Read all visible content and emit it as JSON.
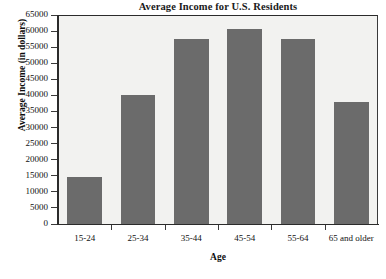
{
  "chart_data": {
    "type": "bar",
    "title": "Average Income for U.S. Residents",
    "xlabel": "Age",
    "ylabel": "Average Income (in dollars)",
    "categories": [
      "15-24",
      "25-34",
      "35-44",
      "45-54",
      "55-64",
      "65 and older"
    ],
    "values": [
      14500,
      40000,
      57500,
      60500,
      57500,
      38000
    ],
    "ylim": [
      0,
      65000
    ],
    "ytick_step": 5000,
    "yticks": [
      0,
      5000,
      10000,
      15000,
      20000,
      25000,
      30000,
      35000,
      40000,
      45000,
      50000,
      55000,
      60000,
      65000
    ],
    "ytick_labels": [
      "0",
      "5000",
      "10000",
      "15000",
      "20000",
      "25000",
      "30000",
      "35000",
      "40000",
      "45000",
      "50000",
      "55000",
      "60000",
      "65000"
    ],
    "grid": false,
    "legend": null,
    "bar_color": "#6b6b6b",
    "plot_background": "#f2f2f0",
    "figure_background": "#ffffff",
    "axis_color": "#2b2b2b"
  }
}
